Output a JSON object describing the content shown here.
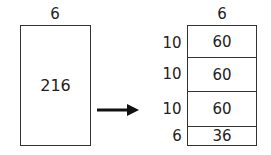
{
  "left": {
    "width_label": "6",
    "area_label": "216"
  },
  "arrow": {
    "direction": "right"
  },
  "right": {
    "width_label": "6",
    "rows": [
      {
        "height_label": "10",
        "area_label": "60"
      },
      {
        "height_label": "10",
        "area_label": "60"
      },
      {
        "height_label": "10",
        "area_label": "60"
      },
      {
        "height_label": "6",
        "area_label": "36"
      }
    ]
  }
}
